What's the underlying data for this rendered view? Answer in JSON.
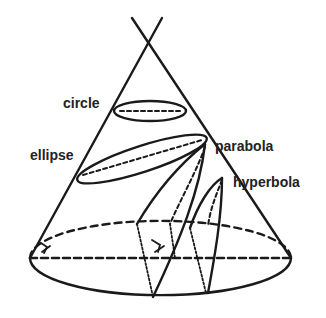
{
  "diagram": {
    "labels": {
      "circle": "circle",
      "ellipse": "ellipse",
      "parabola": "parabola",
      "hyperbola": "hyperbola"
    },
    "colors": {
      "stroke": "#1a1a1a",
      "text": "#222222",
      "background": "#ffffff"
    }
  }
}
